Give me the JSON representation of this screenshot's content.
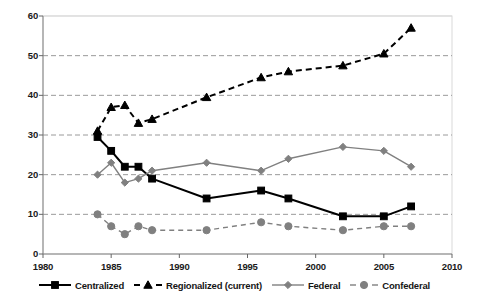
{
  "chart_data": {
    "type": "line",
    "title": "",
    "xlabel": "",
    "ylabel": "",
    "xlim": [
      1980,
      2010
    ],
    "ylim": [
      0,
      60
    ],
    "xticks": [
      1980,
      1985,
      1990,
      1995,
      2000,
      2005,
      2010
    ],
    "yticks": [
      0,
      10,
      20,
      30,
      40,
      50,
      60
    ],
    "grid": "horizontal-dashed",
    "legend_position": "bottom",
    "series": [
      {
        "name": "Centralized",
        "color": "#000000",
        "linestyle": "solid",
        "marker": "square",
        "x": [
          1984,
          1985,
          1986,
          1987,
          1988,
          1992,
          1996,
          1998,
          2002,
          2005,
          2007
        ],
        "values": [
          29.5,
          26,
          22,
          22,
          19,
          14,
          16,
          14,
          9.5,
          9.5,
          12
        ]
      },
      {
        "name": "Regionalized (current)",
        "color": "#000000",
        "linestyle": "dashed",
        "marker": "triangle",
        "x": [
          1984,
          1985,
          1986,
          1987,
          1988,
          1992,
          1996,
          1998,
          2002,
          2005,
          2007
        ],
        "values": [
          31,
          37,
          37.5,
          33,
          34,
          39.5,
          44.5,
          46,
          47.5,
          50.5,
          57
        ]
      },
      {
        "name": "Federal",
        "color": "#808080",
        "linestyle": "solid",
        "marker": "diamond",
        "x": [
          1984,
          1985,
          1986,
          1987,
          1988,
          1992,
          1996,
          1998,
          2002,
          2005,
          2007
        ],
        "values": [
          20,
          23,
          18,
          19,
          21,
          23,
          21,
          24,
          27,
          26,
          22
        ]
      },
      {
        "name": "Confederal",
        "color": "#808080",
        "linestyle": "dashed",
        "marker": "circle",
        "x": [
          1984,
          1985,
          1986,
          1987,
          1988,
          1992,
          1996,
          1998,
          2002,
          2005,
          2007
        ],
        "values": [
          10,
          7,
          5,
          7,
          6,
          6,
          8,
          7,
          6,
          7,
          7
        ]
      }
    ]
  },
  "axes": {
    "y_labels": [
      "60",
      "50",
      "40",
      "30",
      "20",
      "10",
      "0"
    ],
    "x_labels": [
      "1980",
      "1985",
      "1990",
      "1995",
      "2000",
      "2005",
      "2010"
    ]
  },
  "legend": {
    "items": [
      {
        "label": "Centralized",
        "marker": "square-marker-icon",
        "color": "#000000",
        "style": "solid"
      },
      {
        "label": "Regionalized (current)",
        "marker": "triangle-marker-icon",
        "color": "#000000",
        "style": "dashed"
      },
      {
        "label": "Federal",
        "marker": "diamond-marker-icon",
        "color": "#808080",
        "style": "solid"
      },
      {
        "label": "Confederal",
        "marker": "circle-marker-icon",
        "color": "#808080",
        "style": "dashed"
      }
    ]
  }
}
